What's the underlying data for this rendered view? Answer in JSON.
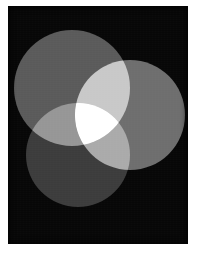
{
  "figure": {
    "background_color": "#ffffff",
    "panel_color": "#070707",
    "panel": {
      "x": 8,
      "y": 6,
      "width": 180,
      "height": 238
    },
    "canvas": {
      "width": 200,
      "height": 256
    },
    "noise_opacity": 0.2
  },
  "chart_data": {
    "type": "venn",
    "subtitle": "",
    "xlabel": "",
    "ylabel": "",
    "grid": false,
    "legend_position": "none",
    "background_color": "#070707",
    "blend_mode": "additive",
    "sets": [
      {
        "name": "top-left-circle",
        "label": "A",
        "cx": 72,
        "cy": 88,
        "r": 58,
        "color": "#5a5a5a",
        "luminance": 90
      },
      {
        "name": "right-circle",
        "label": "B",
        "cx": 130,
        "cy": 115,
        "r": 55,
        "color": "#6e6e6e",
        "luminance": 110
      },
      {
        "name": "bottom-left-circle",
        "label": "C",
        "cx": 78,
        "cy": 155,
        "r": 52,
        "color": "#3c3c3c",
        "luminance": 60
      }
    ],
    "regions": [
      {
        "name": "A only",
        "color": "#5a5a5a",
        "luminance": 90
      },
      {
        "name": "B only",
        "color": "#6e6e6e",
        "luminance": 110
      },
      {
        "name": "C only",
        "color": "#3c3c3c",
        "luminance": 60
      },
      {
        "name": "A and B",
        "color": "#b4b4b4",
        "luminance": 180
      },
      {
        "name": "A and C",
        "color": "#8a8a8a",
        "luminance": 138
      },
      {
        "name": "B and C",
        "color": "#c8c8c8",
        "luminance": 200
      },
      {
        "name": "A and B and C",
        "color": "#f0f0f0",
        "luminance": 240
      },
      {
        "name": "background",
        "color": "#070707",
        "luminance": 7
      }
    ]
  }
}
